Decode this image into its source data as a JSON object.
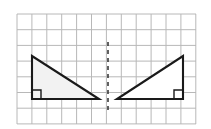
{
  "figure": {
    "canvas": {
      "width": 211,
      "height": 129,
      "background": "#ffffff"
    }
  },
  "grid": {
    "name": "square-grid",
    "x_start": 17,
    "y_start": 14,
    "columns": 12,
    "rows": 7,
    "cell_width": 14.9,
    "cell_height": 15.7,
    "x_end": 196,
    "y_end": 124,
    "line_color": "#b8b8b8",
    "line_width": 1,
    "border_color": "#b0b0b0"
  },
  "mirror_line": {
    "name": "line-of-symmetry",
    "orientation": "vertical",
    "x": 108,
    "y_top": 42,
    "y_bottom": 113,
    "color": "#3a3a3a",
    "width": 1.6,
    "dash": "4 4"
  },
  "shapes": [
    {
      "name": "left-triangle",
      "type": "right-triangle",
      "fill": "#f2f2f2",
      "stroke": "#1a1a1a",
      "stroke_width": 2.1,
      "vertices": [
        {
          "label": "apex",
          "x": 32,
          "y": 56
        },
        {
          "label": "right-angle",
          "x": 32,
          "y": 99
        },
        {
          "label": "base-end",
          "x": 99,
          "y": 99
        }
      ],
      "right_angle_marker": {
        "name": "right-angle-marker-left",
        "corner_x": 32,
        "corner_y": 99,
        "size": 9,
        "direction_x": 1,
        "direction_y": -1,
        "color": "#1a1a1a"
      }
    },
    {
      "name": "right-triangle",
      "type": "right-triangle",
      "fill": "#ffffff",
      "stroke": "#1a1a1a",
      "stroke_width": 2.1,
      "vertices": [
        {
          "label": "apex",
          "x": 183,
          "y": 56
        },
        {
          "label": "right-angle",
          "x": 183,
          "y": 99
        },
        {
          "label": "base-end",
          "x": 117,
          "y": 99
        }
      ],
      "right_angle_marker": {
        "name": "right-angle-marker-right",
        "corner_x": 183,
        "corner_y": 99,
        "size": 9,
        "direction_x": -1,
        "direction_y": -1,
        "color": "#1a1a1a"
      }
    }
  ]
}
